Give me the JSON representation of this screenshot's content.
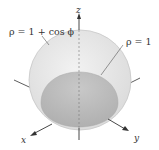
{
  "figure": {
    "type": "3d-surface-diagram",
    "labels": {
      "outer_surface": "ρ = 1 + cos ϕ",
      "inner_surface": "ρ = 1",
      "axis_x": "x",
      "axis_y": "y",
      "axis_z": "z"
    },
    "colors": {
      "outer_fill": "#e6e6e6",
      "outer_edge": "#c8c8c8",
      "inner_fill": "#bdbdbd",
      "axis": "#333333",
      "background": "#ffffff"
    }
  }
}
